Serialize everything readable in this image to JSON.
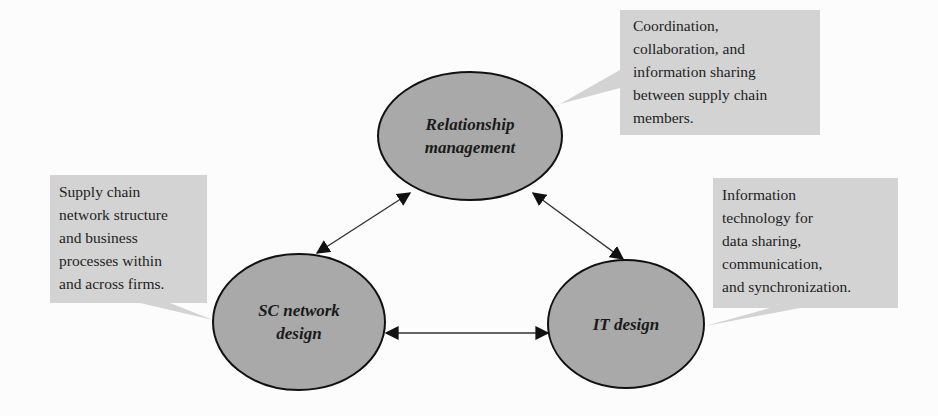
{
  "diagram": {
    "colors": {
      "background": "#fcfcfc",
      "node_fill": "#a9a9a9",
      "node_stroke": "#111111",
      "callout_fill": "#d3d3d3",
      "arrow": "#333333",
      "text": "#1e1e1e"
    },
    "nodes": [
      {
        "id": "relationship",
        "label": "Relationship\nmanagement"
      },
      {
        "id": "network",
        "label": "SC network\ndesign"
      },
      {
        "id": "it",
        "label": "IT design"
      }
    ],
    "callouts": [
      {
        "for": "relationship",
        "text": "Coordination,\ncollaboration, and\ninformation sharing\nbetween supply chain\nmembers."
      },
      {
        "for": "network",
        "text": "Supply chain\nnetwork structure\nand business\nprocesses within\nand across firms."
      },
      {
        "for": "it",
        "text": "Information\ntechnology for\ndata sharing,\ncommunication,\nand synchronization."
      }
    ],
    "edges": [
      {
        "from": "relationship",
        "to": "network",
        "direction": "bidirectional"
      },
      {
        "from": "relationship",
        "to": "it",
        "direction": "bidirectional"
      },
      {
        "from": "network",
        "to": "it",
        "direction": "bidirectional"
      }
    ]
  }
}
